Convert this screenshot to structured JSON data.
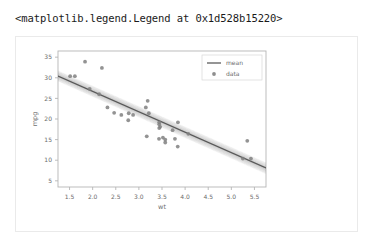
{
  "output": {
    "repr_text": "<matplotlib.legend.Legend at 0x1d528b15220>"
  },
  "chart_data": {
    "type": "scatter",
    "title": "",
    "xlabel": "wt",
    "ylabel": "mpg",
    "xlim": [
      1.25,
      5.75
    ],
    "ylim": [
      3.5,
      36.5
    ],
    "xticks": [
      1.5,
      2.0,
      2.5,
      3.0,
      3.5,
      4.0,
      4.5,
      5.0,
      5.5
    ],
    "xticklabels": [
      "1.5",
      "2.0",
      "2.5",
      "3.0",
      "3.5",
      "4.0",
      "4.5",
      "5.0",
      "5.5"
    ],
    "yticks": [
      5,
      10,
      15,
      20,
      25,
      30,
      35
    ],
    "yticklabels": [
      "5",
      "10",
      "15",
      "20",
      "25",
      "30",
      "35"
    ],
    "grid": false,
    "legend": {
      "position": "upper right",
      "entries": [
        {
          "label": "mean",
          "kind": "line",
          "color": "#4d4d4d"
        },
        {
          "label": "data",
          "kind": "marker",
          "color": "#7a7a7a"
        }
      ]
    },
    "colors": {
      "marker": "#808080",
      "mean_line": "#4d4d4d",
      "uncertainty_band": "#9a9a9a",
      "axes_frame": "#b5b5b5",
      "tick_label": "#6b6b6b",
      "axis_label": "#6b6b6b",
      "card_border": "#eaeaea",
      "background": "#ffffff"
    },
    "series": [
      {
        "name": "data",
        "x": [
          2.62,
          2.875,
          2.32,
          3.215,
          3.44,
          3.46,
          3.57,
          3.19,
          3.15,
          3.44,
          3.44,
          4.07,
          3.73,
          3.78,
          5.25,
          5.424,
          5.345,
          2.2,
          1.615,
          1.835,
          2.465,
          3.52,
          3.435,
          3.84,
          3.845,
          1.935,
          2.14,
          1.513,
          3.17,
          2.77,
          3.57,
          2.78
        ],
        "y": [
          21.0,
          21.0,
          22.8,
          21.4,
          18.7,
          18.1,
          14.3,
          24.4,
          22.8,
          19.2,
          17.8,
          16.4,
          17.3,
          15.2,
          10.4,
          10.4,
          14.7,
          32.4,
          30.4,
          33.9,
          21.5,
          15.5,
          15.2,
          13.3,
          19.2,
          27.3,
          26.0,
          30.4,
          15.8,
          19.7,
          15.0,
          21.4
        ]
      },
      {
        "name": "mean",
        "kind": "line",
        "x": [
          1.25,
          5.75
        ],
        "y": [
          30.4,
          8.1
        ],
        "slope": -4.96,
        "intercept": 36.6
      }
    ],
    "uncertainty_band": {
      "description": "posterior sample fan around mean regression line",
      "x": [
        1.25,
        5.75
      ],
      "y_lower": [
        29.2,
        6.7
      ],
      "y_upper": [
        31.7,
        9.4
      ]
    }
  }
}
